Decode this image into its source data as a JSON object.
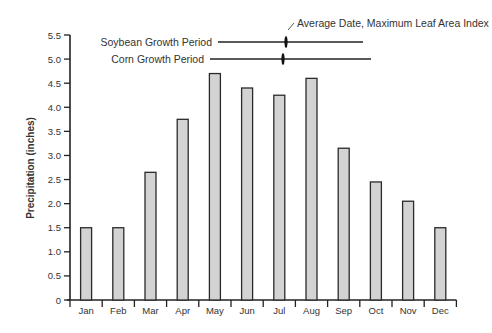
{
  "chart_data": {
    "type": "bar",
    "title": "",
    "xlabel": "",
    "ylabel": "Precipitation (inches)",
    "ylim": [
      0,
      5.5
    ],
    "yticks": [
      0,
      0.5,
      1.0,
      1.5,
      2.0,
      2.5,
      3.0,
      3.5,
      4.0,
      4.5,
      5.0,
      5.5
    ],
    "ytick_labels": [
      "0",
      "0.5",
      "1.0",
      "1.5",
      "2.0",
      "2.5",
      "3.0",
      "3.5",
      "4.0",
      "4.5",
      "5.0",
      "5.5"
    ],
    "categories": [
      "Jan",
      "Feb",
      "Mar",
      "Apr",
      "May",
      "Jun",
      "Jul",
      "Aug",
      "Sep",
      "Oct",
      "Nov",
      "Dec"
    ],
    "values": [
      1.5,
      1.5,
      2.65,
      3.75,
      4.7,
      4.4,
      4.25,
      4.6,
      3.15,
      2.45,
      2.05,
      1.5
    ],
    "grid": false,
    "bar_color": "#d3d3d3",
    "bar_edge_color": "#2a2a2a",
    "annotations": [
      {
        "label": "Soybean Growth Period",
        "type": "range-line"
      },
      {
        "label": "Corn Growth Period",
        "type": "range-line"
      },
      {
        "label": "Average Date, Maximum Leaf Area Index",
        "type": "marker-callout"
      }
    ]
  }
}
